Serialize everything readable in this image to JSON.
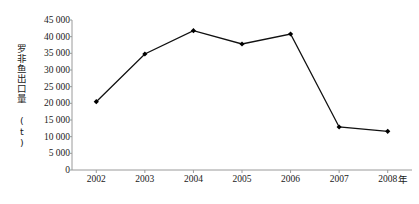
{
  "chart_data": {
    "type": "line",
    "title": "",
    "xlabel": "年",
    "ylabel": "罗非鱼出口量 (t)",
    "categories": [
      "2002",
      "2003",
      "2004",
      "2005",
      "2006",
      "2007",
      "2008"
    ],
    "values": [
      20500,
      34800,
      41800,
      37800,
      40800,
      12900,
      11600
    ],
    "series": [
      {
        "name": "罗非鱼出口量",
        "values": [
          20500,
          34800,
          41800,
          37800,
          40800,
          12900,
          11600
        ]
      }
    ],
    "ylim": [
      0,
      45000
    ],
    "ytick_values": [
      0,
      5000,
      10000,
      15000,
      20000,
      25000,
      30000,
      35000,
      40000,
      45000
    ],
    "ytick_labels": [
      "0",
      "5 000",
      "10 000",
      "15 000",
      "20 000",
      "25 000",
      "30 000",
      "35 000",
      "40 000",
      "45 000"
    ],
    "xtick_labels": [
      "2002",
      "2003",
      "2004",
      "2005",
      "2006",
      "2007",
      "2008"
    ],
    "grid": false,
    "legend": "none",
    "line_color": "#111111",
    "marker": "diamond",
    "marker_color": "#000000",
    "axis_color": "#9a9a9a",
    "background": "#ffffff"
  },
  "axis": {
    "y_title": "罗非鱼出口量 (t)",
    "x_unit": "年"
  }
}
